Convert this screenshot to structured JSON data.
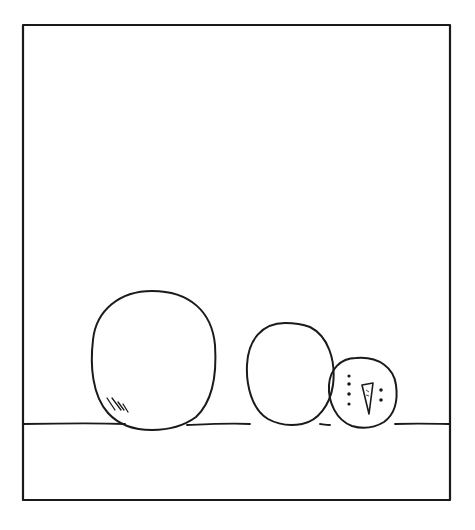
{
  "panel": {
    "description": "Hand-drawn comic panel: three snowballs of decreasing size resting on the ground; the smallest has a snowman face",
    "stroke_color": "#1a1a1a",
    "background": "#ffffff"
  },
  "figures": [
    {
      "name": "large-snowball",
      "size": "large"
    },
    {
      "name": "medium-snowball",
      "size": "medium"
    },
    {
      "name": "small-snowball-head",
      "size": "small",
      "face": {
        "eyes_left": 4,
        "carrot_nose": true,
        "eyes_right": 2
      }
    }
  ]
}
